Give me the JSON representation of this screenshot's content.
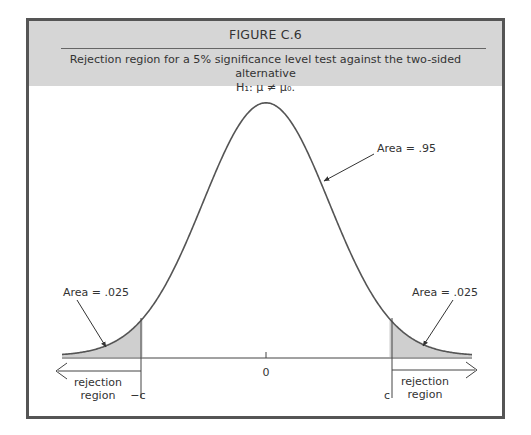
{
  "figure": {
    "title": "FIGURE C.6",
    "caption_line1": "Rejection region for a 5% significance level test against the two-sided alternative",
    "caption_line2": "H₁: μ ≠ μ₀."
  },
  "chart_data": {
    "type": "area",
    "title": "FIGURE C.6",
    "subtitle": "Rejection region for a 5% significance level test against the two-sided alternative H1: mu != mu0.",
    "distribution": "standard normal",
    "xlabel": "",
    "ylabel": "",
    "x_ticks": [
      {
        "position": -1.96,
        "label": "−c"
      },
      {
        "position": 0,
        "label": "0"
      },
      {
        "position": 1.96,
        "label": "c"
      }
    ],
    "xlim": [
      -3.2,
      3.2
    ],
    "grid": false,
    "shaded_regions": [
      {
        "from": "-inf",
        "to": -1.96,
        "area": 0.025,
        "label": "Area = .025",
        "region_label": "rejection region"
      },
      {
        "from": 1.96,
        "to": "inf",
        "area": 0.025,
        "label": "Area = .025",
        "region_label": "rejection region"
      }
    ],
    "annotations": [
      {
        "text": "Area = .95",
        "target": "central region"
      },
      {
        "text": "Area = .025",
        "target": "left tail"
      },
      {
        "text": "Area = .025",
        "target": "right tail"
      },
      {
        "text": "rejection region",
        "target": "left of -c"
      },
      {
        "text": "rejection region",
        "target": "right of c"
      }
    ],
    "fill_color": "#cfcfcf",
    "line_color": "#555555"
  },
  "labels": {
    "center_area": "Area = .95",
    "left_area": "Area = .025",
    "right_area": "Area = .025",
    "zero_tick": "0",
    "neg_c": "−c",
    "pos_c": "c",
    "left_region_1": "rejection",
    "left_region_2": "region",
    "right_region_1": "rejection",
    "right_region_2": "region"
  }
}
